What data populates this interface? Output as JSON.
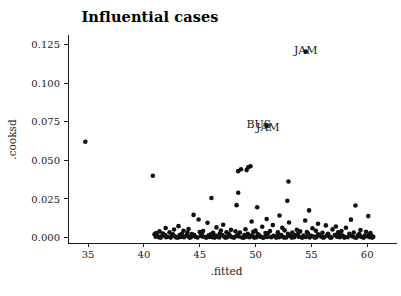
{
  "chart_data": {
    "type": "scatter",
    "title": "Influential cases",
    "xlabel": ".fitted",
    "ylabel": ".cooksd",
    "xlim": [
      33.2,
      61.6
    ],
    "ylim": [
      -0.0035,
      0.1305
    ],
    "grid": false,
    "legend": null,
    "xticks": [
      35,
      40,
      45,
      50,
      55,
      60
    ],
    "xticklabels": [
      "35",
      "40",
      "45",
      "50",
      "55",
      "60"
    ],
    "yticks": [
      0.0,
      0.025,
      0.05,
      0.075,
      0.1,
      0.125
    ],
    "yticklabels": [
      "0.000",
      "0.025",
      "0.050",
      "0.075",
      "0.100",
      "0.125"
    ],
    "annotations": [
      {
        "text": "JAM",
        "x": 54.5,
        "y": 0.1215
      },
      {
        "text": "BUS",
        "x": 50.3,
        "y": 0.0735
      },
      {
        "text": "JAM",
        "x": 51.1,
        "y": 0.0718
      }
    ],
    "point_color": "#111111",
    "point_radius": 2.3,
    "points": [
      [
        34.75,
        0.062
      ],
      [
        40.8,
        0.04
      ],
      [
        48.45,
        0.043
      ],
      [
        48.7,
        0.0442
      ],
      [
        49.35,
        0.0455
      ],
      [
        49.2,
        0.0437
      ],
      [
        49.55,
        0.0462
      ],
      [
        52.95,
        0.0363
      ],
      [
        48.45,
        0.029
      ],
      [
        46.05,
        0.0256
      ],
      [
        52.85,
        0.0238
      ],
      [
        48.3,
        0.021
      ],
      [
        50.15,
        0.0196
      ],
      [
        58.95,
        0.0208
      ],
      [
        54.8,
        0.0176
      ],
      [
        44.45,
        0.0147
      ],
      [
        52.15,
        0.0143
      ],
      [
        60.1,
        0.0139
      ],
      [
        44.9,
        0.0117
      ],
      [
        51.0,
        0.012
      ],
      [
        58.55,
        0.0116
      ],
      [
        54.45,
        0.0111
      ],
      [
        49.65,
        0.0104
      ],
      [
        45.7,
        0.0096
      ],
      [
        53.0,
        0.0098
      ],
      [
        55.6,
        0.009
      ],
      [
        47.1,
        0.0083
      ],
      [
        51.55,
        0.0081
      ],
      [
        56.3,
        0.0079
      ],
      [
        43.1,
        0.0074
      ],
      [
        50.6,
        0.007
      ],
      [
        57.2,
        0.0072
      ],
      [
        41.95,
        0.0062
      ],
      [
        46.5,
        0.0066
      ],
      [
        52.4,
        0.0063
      ],
      [
        55.1,
        0.006
      ],
      [
        58.1,
        0.0064
      ],
      [
        42.7,
        0.0052
      ],
      [
        44.0,
        0.0056
      ],
      [
        47.8,
        0.005
      ],
      [
        49.1,
        0.0054
      ],
      [
        53.7,
        0.0051
      ],
      [
        56.9,
        0.0053
      ],
      [
        59.4,
        0.0049
      ],
      [
        41.4,
        0.004
      ],
      [
        43.55,
        0.0044
      ],
      [
        45.3,
        0.0043
      ],
      [
        46.9,
        0.0046
      ],
      [
        48.2,
        0.0041
      ],
      [
        50.0,
        0.0045
      ],
      [
        51.3,
        0.0042
      ],
      [
        52.6,
        0.0047
      ],
      [
        54.0,
        0.004
      ],
      [
        55.4,
        0.0044
      ],
      [
        57.7,
        0.0042
      ],
      [
        59.9,
        0.0038
      ],
      [
        41.1,
        0.003
      ],
      [
        42.3,
        0.0034
      ],
      [
        43.9,
        0.0032
      ],
      [
        45.0,
        0.0036
      ],
      [
        46.2,
        0.0031
      ],
      [
        47.4,
        0.0035
      ],
      [
        48.6,
        0.0033
      ],
      [
        49.8,
        0.0037
      ],
      [
        50.9,
        0.003
      ],
      [
        52.0,
        0.0034
      ],
      [
        53.3,
        0.0032
      ],
      [
        54.6,
        0.0036
      ],
      [
        56.0,
        0.0031
      ],
      [
        57.4,
        0.0035
      ],
      [
        58.8,
        0.0033
      ],
      [
        60.3,
        0.0029
      ],
      [
        40.95,
        0.0022
      ],
      [
        41.7,
        0.0026
      ],
      [
        42.6,
        0.0021
      ],
      [
        43.4,
        0.0025
      ],
      [
        44.3,
        0.0023
      ],
      [
        45.2,
        0.0027
      ],
      [
        46.0,
        0.0022
      ],
      [
        46.8,
        0.0026
      ],
      [
        47.6,
        0.0024
      ],
      [
        48.4,
        0.002
      ],
      [
        49.3,
        0.0025
      ],
      [
        50.2,
        0.0023
      ],
      [
        51.1,
        0.0027
      ],
      [
        52.0,
        0.0021
      ],
      [
        52.9,
        0.0025
      ],
      [
        53.8,
        0.0023
      ],
      [
        54.7,
        0.0026
      ],
      [
        55.6,
        0.0022
      ],
      [
        56.5,
        0.0024
      ],
      [
        57.5,
        0.0021
      ],
      [
        58.4,
        0.0025
      ],
      [
        59.3,
        0.0023
      ],
      [
        60.2,
        0.0019
      ],
      [
        41.2,
        0.0014
      ],
      [
        41.9,
        0.0017
      ],
      [
        42.5,
        0.0012
      ],
      [
        43.2,
        0.0016
      ],
      [
        43.8,
        0.0013
      ],
      [
        44.5,
        0.0017
      ],
      [
        45.1,
        0.0012
      ],
      [
        45.8,
        0.0015
      ],
      [
        46.4,
        0.0013
      ],
      [
        47.0,
        0.0017
      ],
      [
        47.7,
        0.0014
      ],
      [
        48.3,
        0.0012
      ],
      [
        49.0,
        0.0016
      ],
      [
        49.6,
        0.0013
      ],
      [
        50.3,
        0.0017
      ],
      [
        50.95,
        0.0014
      ],
      [
        51.6,
        0.0012
      ],
      [
        52.3,
        0.0016
      ],
      [
        53.0,
        0.0013
      ],
      [
        53.6,
        0.0017
      ],
      [
        54.3,
        0.0014
      ],
      [
        55.0,
        0.0012
      ],
      [
        55.7,
        0.0016
      ],
      [
        56.4,
        0.0013
      ],
      [
        57.1,
        0.0017
      ],
      [
        57.8,
        0.0014
      ],
      [
        58.6,
        0.0012
      ],
      [
        59.2,
        0.0016
      ],
      [
        59.8,
        0.0013
      ],
      [
        60.4,
        0.0011
      ],
      [
        41.05,
        0.0006
      ],
      [
        41.6,
        0.0008
      ],
      [
        42.1,
        0.0005
      ],
      [
        42.8,
        0.0007
      ],
      [
        43.3,
        0.0004
      ],
      [
        43.95,
        0.0008
      ],
      [
        44.6,
        0.0005
      ],
      [
        45.25,
        0.0007
      ],
      [
        45.9,
        0.0004
      ],
      [
        46.55,
        0.0008
      ],
      [
        47.2,
        0.0006
      ],
      [
        47.85,
        0.0004
      ],
      [
        48.5,
        0.0007
      ],
      [
        49.15,
        0.0005
      ],
      [
        49.75,
        0.0008
      ],
      [
        50.45,
        0.0006
      ],
      [
        51.05,
        0.0004
      ],
      [
        51.75,
        0.0007
      ],
      [
        52.45,
        0.0005
      ],
      [
        53.15,
        0.0008
      ],
      [
        53.85,
        0.0006
      ],
      [
        54.5,
        0.0004
      ],
      [
        55.2,
        0.0007
      ],
      [
        55.9,
        0.0005
      ],
      [
        56.6,
        0.0008
      ],
      [
        57.3,
        0.0006
      ],
      [
        58.0,
        0.0004
      ],
      [
        58.7,
        0.0007
      ],
      [
        59.45,
        0.0005
      ],
      [
        60.05,
        0.0008
      ],
      [
        60.55,
        0.0005
      ],
      [
        41.35,
        0.0002
      ],
      [
        42.0,
        0.0003
      ],
      [
        42.9,
        0.0001
      ],
      [
        43.6,
        0.0003
      ],
      [
        44.2,
        0.0002
      ],
      [
        44.8,
        0.0001
      ],
      [
        45.5,
        0.0003
      ],
      [
        46.15,
        0.0002
      ],
      [
        46.75,
        0.0001
      ],
      [
        47.45,
        0.0003
      ],
      [
        48.1,
        0.0002
      ],
      [
        48.8,
        0.0001
      ],
      [
        49.45,
        0.0003
      ],
      [
        50.1,
        0.0002
      ],
      [
        50.75,
        0.0001
      ],
      [
        51.4,
        0.0003
      ],
      [
        52.1,
        0.0002
      ],
      [
        52.75,
        0.0001
      ],
      [
        53.45,
        0.0003
      ],
      [
        54.1,
        0.0002
      ],
      [
        54.85,
        0.0001
      ],
      [
        55.45,
        0.0003
      ],
      [
        56.15,
        0.0002
      ],
      [
        56.8,
        0.0001
      ],
      [
        57.55,
        0.0003
      ],
      [
        58.25,
        0.0002
      ],
      [
        58.9,
        0.0001
      ],
      [
        59.6,
        0.0003
      ],
      [
        60.25,
        0.0002
      ],
      [
        41.5,
        0.0
      ],
      [
        42.4,
        0.0
      ],
      [
        43.05,
        0.0
      ],
      [
        44.1,
        0.0
      ],
      [
        45.6,
        0.0
      ],
      [
        46.35,
        0.0
      ],
      [
        47.3,
        0.0
      ],
      [
        48.05,
        0.0
      ],
      [
        48.95,
        0.0
      ],
      [
        49.9,
        0.0
      ],
      [
        50.65,
        0.0
      ],
      [
        51.85,
        0.0
      ],
      [
        52.55,
        0.0
      ],
      [
        53.25,
        0.0
      ],
      [
        54.2,
        0.0
      ],
      [
        55.3,
        0.0
      ],
      [
        56.05,
        0.0
      ],
      [
        56.7,
        0.0
      ],
      [
        57.95,
        0.0
      ],
      [
        59.05,
        0.0
      ],
      [
        59.7,
        0.0
      ],
      [
        60.45,
        0.0
      ],
      [
        51.0,
        0.0723
      ],
      [
        54.5,
        0.1205
      ]
    ]
  }
}
